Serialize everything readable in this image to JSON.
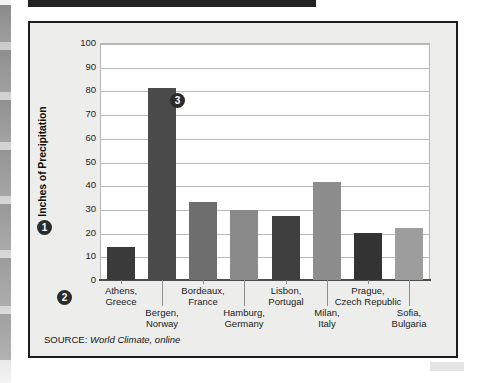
{
  "figure": {
    "source_prefix": "SOURCE:",
    "source_reference": "World Climate, online"
  },
  "callouts": [
    {
      "id": "callout-1",
      "label": "❶",
      "number": "1"
    },
    {
      "id": "callout-2",
      "label": "❷",
      "number": "2"
    },
    {
      "id": "callout-3",
      "label": "❸",
      "number": "3"
    }
  ],
  "chart_data": {
    "type": "bar",
    "title": "",
    "xlabel": "",
    "ylabel": "Inches of Precipitation",
    "ylim": [
      0,
      100
    ],
    "ytick_labels": [
      "100",
      "90",
      "80",
      "70",
      "60",
      "50",
      "40",
      "30",
      "20",
      "10",
      "0"
    ],
    "yticks": [
      100,
      90,
      80,
      70,
      60,
      50,
      40,
      30,
      20,
      10,
      0
    ],
    "grid": true,
    "legend": "none",
    "categories": [
      "Athens,\nGreece",
      "Bergen,\nNorway",
      "Bordeaux,\nFrance",
      "Hamburg,\nGermany",
      "Lisbon,\nPortugal",
      "Milan,\nItaly",
      "Prague,\nCzech Republic",
      "Sofia,\nBulgaria"
    ],
    "bars": [
      {
        "city": "Athens,",
        "country": "Greece",
        "value": 14,
        "color": "#3a3a3a",
        "row": "upper"
      },
      {
        "city": "Bergen,",
        "country": "Norway",
        "value": 81,
        "color": "#4a4a4a",
        "row": "lower"
      },
      {
        "city": "Bordeaux,",
        "country": "France",
        "value": 33,
        "color": "#6e6e6e",
        "row": "upper"
      },
      {
        "city": "Hamburg,",
        "country": "Germany",
        "value": 29.5,
        "color": "#8a8a8a",
        "row": "lower"
      },
      {
        "city": "Lisbon,",
        "country": "Portugal",
        "value": 27,
        "color": "#3f3f3f",
        "row": "upper"
      },
      {
        "city": "Milan,",
        "country": "Italy",
        "value": 41.5,
        "color": "#8d8d8d",
        "row": "lower"
      },
      {
        "city": "Prague,",
        "country": "Czech Republic",
        "value": 20,
        "color": "#333333",
        "row": "upper"
      },
      {
        "city": "Sofia,",
        "country": "Bulgaria",
        "value": 22,
        "color": "#9d9d9d",
        "row": "lower"
      }
    ],
    "values": [
      14,
      81,
      33,
      29.5,
      27,
      41.5,
      20,
      22
    ]
  }
}
